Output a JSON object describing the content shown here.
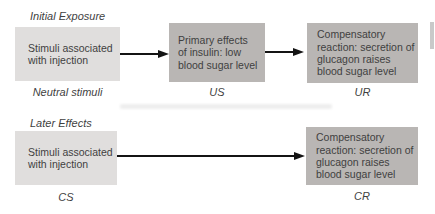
{
  "figure": {
    "background": "#ffffff",
    "colors": {
      "box_light": "#e0dedd",
      "box_dark": "#b9b6b4",
      "text": "#3f3f3f",
      "arrow": "#141414",
      "page_edge_artifact": "#c9c9c9"
    },
    "rows": [
      {
        "section_label": "Initial Exposure",
        "boxes": [
          {
            "text": "Stimuli associated\nwith injection",
            "caption": "Neutral stimuli",
            "tone": "light"
          },
          {
            "text": "Primary effects\nof insulin: low\nblood sugar level",
            "caption": "US",
            "tone": "dark"
          },
          {
            "text": "Compensatory\nreaction: secretion of\nglucagon raises\nblood sugar level",
            "caption": "UR",
            "tone": "dark"
          }
        ]
      },
      {
        "section_label": "Later Effects",
        "boxes": [
          {
            "text": "Stimuli associated\nwith injection",
            "caption": "CS",
            "tone": "light"
          },
          {
            "text": "Compensatory\nreaction: secretion of\nglucagon raises\nblood sugar level",
            "caption": "CR",
            "tone": "dark"
          }
        ]
      }
    ]
  }
}
